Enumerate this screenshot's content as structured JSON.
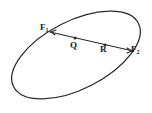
{
  "figure": {
    "kind": "geometry-diagram",
    "background_color": "#ffffff",
    "stroke_color": "#2b2b2b",
    "width": 152,
    "height": 113,
    "ellipse": {
      "center_x": 76,
      "center_y": 55,
      "radius_x": 70,
      "radius_y": 34,
      "rotation_deg": -27
    },
    "segment": {
      "x1": 50,
      "y1": 32,
      "x2": 133,
      "y2": 51
    },
    "points": [
      {
        "id": "F1",
        "label": "F",
        "subscript": "1",
        "x": 50,
        "y": 32,
        "label_x": 40,
        "label_y": 23,
        "has_dot": false
      },
      {
        "id": "Q",
        "label": "Q",
        "subscript": "",
        "x": 75,
        "y": 38,
        "label_x": 70,
        "label_y": 41,
        "has_dot": true
      },
      {
        "id": "R",
        "label": "R",
        "subscript": "",
        "x": 105,
        "y": 45,
        "label_x": 100,
        "label_y": 45,
        "has_dot": true
      },
      {
        "id": "F2",
        "label": "F",
        "subscript": "2",
        "x": 133,
        "y": 51,
        "label_x": 131,
        "label_y": 45,
        "has_dot": false
      }
    ],
    "labels": {
      "f1": "F",
      "f1_sub": "1",
      "f2": "F",
      "f2_sub": "2",
      "q": "Q",
      "r": "R"
    }
  }
}
